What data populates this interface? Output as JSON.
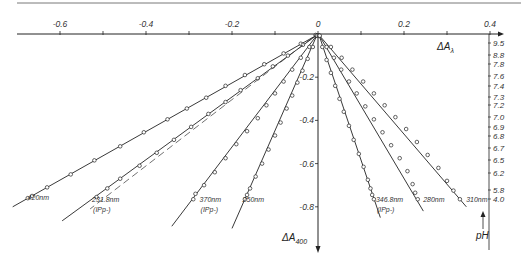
{
  "chart_data": {
    "type": "line",
    "title": "",
    "xlabel": "ΔAλ",
    "ylabel": "ΔA400",
    "xlim": [
      -0.72,
      0.42
    ],
    "ylim": [
      -1.0,
      0.0
    ],
    "x_ticks": [
      {
        "value": -0.6,
        "label": "-0.6"
      },
      {
        "value": -0.5,
        "label": ""
      },
      {
        "value": -0.4,
        "label": "-0.4"
      },
      {
        "value": -0.3,
        "label": ""
      },
      {
        "value": -0.2,
        "label": "-0.2"
      },
      {
        "value": -0.1,
        "label": ""
      },
      {
        "value": 0.0,
        "label": "0"
      },
      {
        "value": 0.1,
        "label": ""
      },
      {
        "value": 0.2,
        "label": "0.2"
      },
      {
        "value": 0.3,
        "label": ""
      },
      {
        "value": 0.4,
        "label": "0.4"
      }
    ],
    "y_ticks": [
      {
        "value": -0.2,
        "label": "-0.2"
      },
      {
        "value": -0.4,
        "label": "-0.4"
      },
      {
        "value": -0.6,
        "label": "-0.6"
      },
      {
        "value": -0.8,
        "label": "-0.8"
      }
    ],
    "grid": false,
    "ph_scale": {
      "label": "pH",
      "values": [
        "9.5",
        "8.8",
        "7.8",
        "7.6",
        "7.4",
        "7.3",
        "7.2",
        "7.0",
        "6.9",
        "6.8",
        "6.7",
        "6.5",
        "6.2",
        "5.8",
        "4.0"
      ]
    },
    "series": [
      {
        "name": "420nm",
        "sublabel": "",
        "style": "solid",
        "end": [
          -0.71,
          -0.8
        ],
        "label_at": [
          -0.68,
          -0.76
        ],
        "points": [
          [
            -0.005,
            -0.005
          ],
          [
            -0.04,
            -0.045
          ],
          [
            -0.08,
            -0.09
          ],
          [
            -0.125,
            -0.14
          ],
          [
            -0.17,
            -0.19
          ],
          [
            -0.215,
            -0.24
          ],
          [
            -0.26,
            -0.295
          ],
          [
            -0.305,
            -0.345
          ],
          [
            -0.35,
            -0.395
          ],
          [
            -0.405,
            -0.455
          ],
          [
            -0.46,
            -0.52
          ],
          [
            -0.52,
            -0.585
          ],
          [
            -0.575,
            -0.65
          ],
          [
            -0.63,
            -0.71
          ],
          [
            -0.665,
            -0.75
          ],
          [
            -0.675,
            -0.76
          ]
        ]
      },
      {
        "name": "231.8nm",
        "sublabel": "(IPp-)",
        "style": "solid",
        "end": [
          -0.595,
          -0.865
        ],
        "label_at": [
          -0.53,
          -0.77
        ],
        "points": [
          [
            -0.005,
            -0.005
          ],
          [
            -0.035,
            -0.05
          ],
          [
            -0.07,
            -0.1
          ],
          [
            -0.105,
            -0.15
          ],
          [
            -0.14,
            -0.205
          ],
          [
            -0.18,
            -0.26
          ],
          [
            -0.215,
            -0.315
          ],
          [
            -0.255,
            -0.37
          ],
          [
            -0.295,
            -0.43
          ],
          [
            -0.335,
            -0.49
          ],
          [
            -0.375,
            -0.55
          ],
          [
            -0.415,
            -0.61
          ],
          [
            -0.46,
            -0.67
          ],
          [
            -0.49,
            -0.715
          ],
          [
            -0.515,
            -0.755
          ]
        ]
      },
      {
        "name": "dashed-reference",
        "sublabel": "",
        "style": "dashed",
        "end": [
          -0.53,
          -0.81
        ],
        "label_at": null,
        "points": []
      },
      {
        "name": "370nm",
        "sublabel": "(IPp-)",
        "style": "solid",
        "end": [
          -0.34,
          -0.89
        ],
        "label_at": [
          -0.28,
          -0.77
        ],
        "points": [
          [
            -0.003,
            -0.008
          ],
          [
            -0.02,
            -0.06
          ],
          [
            -0.04,
            -0.11
          ],
          [
            -0.06,
            -0.165
          ],
          [
            -0.08,
            -0.22
          ],
          [
            -0.1,
            -0.275
          ],
          [
            -0.12,
            -0.33
          ],
          [
            -0.14,
            -0.39
          ],
          [
            -0.165,
            -0.45
          ],
          [
            -0.19,
            -0.51
          ],
          [
            -0.215,
            -0.575
          ],
          [
            -0.24,
            -0.64
          ],
          [
            -0.265,
            -0.7
          ],
          [
            -0.285,
            -0.74
          ],
          [
            -0.29,
            -0.765
          ]
        ]
      },
      {
        "name": "250nm",
        "sublabel": "",
        "style": "solid",
        "end": [
          -0.2,
          -0.9
        ],
        "label_at": [
          -0.18,
          -0.77
        ],
        "points": [
          [
            -0.002,
            -0.008
          ],
          [
            -0.012,
            -0.06
          ],
          [
            -0.024,
            -0.115
          ],
          [
            -0.036,
            -0.17
          ],
          [
            -0.048,
            -0.225
          ],
          [
            -0.06,
            -0.285
          ],
          [
            -0.073,
            -0.345
          ],
          [
            -0.087,
            -0.41
          ],
          [
            -0.1,
            -0.47
          ],
          [
            -0.115,
            -0.535
          ],
          [
            -0.13,
            -0.6
          ],
          [
            -0.145,
            -0.66
          ],
          [
            -0.158,
            -0.715
          ],
          [
            -0.165,
            -0.745
          ],
          [
            -0.17,
            -0.765
          ]
        ]
      },
      {
        "name": "346.8nm",
        "sublabel": "(IPp-)",
        "style": "solid",
        "end": [
          0.145,
          -0.85
        ],
        "label_at": [
          0.13,
          -0.77
        ],
        "points": [
          [
            0.002,
            -0.008
          ],
          [
            0.01,
            -0.06
          ],
          [
            0.02,
            -0.12
          ],
          [
            0.03,
            -0.18
          ],
          [
            0.04,
            -0.24
          ],
          [
            0.05,
            -0.3
          ],
          [
            0.06,
            -0.36
          ],
          [
            0.072,
            -0.425
          ],
          [
            0.083,
            -0.49
          ],
          [
            0.095,
            -0.555
          ],
          [
            0.106,
            -0.615
          ],
          [
            0.116,
            -0.675
          ],
          [
            0.122,
            -0.715
          ],
          [
            0.126,
            -0.745
          ],
          [
            0.13,
            -0.765
          ]
        ]
      },
      {
        "name": "280nm",
        "sublabel": "",
        "style": "solid",
        "end": [
          0.245,
          -0.82
        ],
        "label_at": [
          0.24,
          -0.77
        ],
        "points": [
          [
            0.003,
            -0.008
          ],
          [
            0.02,
            -0.06
          ],
          [
            0.037,
            -0.11
          ],
          [
            0.054,
            -0.165
          ],
          [
            0.072,
            -0.22
          ],
          [
            0.09,
            -0.275
          ],
          [
            0.11,
            -0.335
          ],
          [
            0.13,
            -0.395
          ],
          [
            0.15,
            -0.455
          ],
          [
            0.17,
            -0.515
          ],
          [
            0.19,
            -0.575
          ],
          [
            0.208,
            -0.635
          ],
          [
            0.22,
            -0.695
          ],
          [
            0.226,
            -0.735
          ],
          [
            0.232,
            -0.765
          ]
        ]
      },
      {
        "name": "310nm",
        "sublabel": "",
        "style": "solid",
        "end": [
          0.345,
          -0.8
        ],
        "label_at": [
          0.34,
          -0.77
        ],
        "points": [
          [
            0.004,
            -0.008
          ],
          [
            0.03,
            -0.06
          ],
          [
            0.055,
            -0.11
          ],
          [
            0.08,
            -0.165
          ],
          [
            0.105,
            -0.22
          ],
          [
            0.13,
            -0.275
          ],
          [
            0.155,
            -0.33
          ],
          [
            0.18,
            -0.385
          ],
          [
            0.205,
            -0.44
          ],
          [
            0.23,
            -0.5
          ],
          [
            0.255,
            -0.56
          ],
          [
            0.28,
            -0.62
          ],
          [
            0.3,
            -0.68
          ],
          [
            0.315,
            -0.725
          ],
          [
            0.33,
            -0.765
          ]
        ]
      }
    ]
  }
}
